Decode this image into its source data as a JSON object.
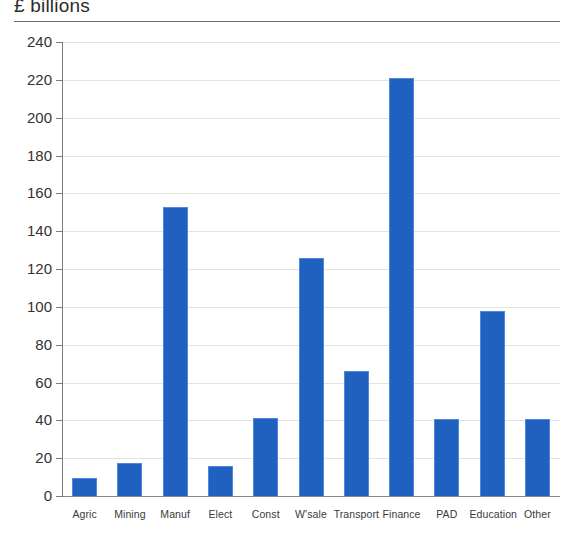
{
  "chart_data": {
    "type": "bar",
    "title": "£ billions",
    "subtitle": "",
    "xlabel": "",
    "ylabel": "",
    "ylim": [
      0,
      240
    ],
    "ytick_step": 20,
    "yticks": [
      0,
      20,
      40,
      60,
      80,
      100,
      120,
      140,
      160,
      180,
      200,
      220,
      240
    ],
    "ytick_labels": [
      "0",
      "20",
      "40",
      "60",
      "80",
      "100",
      "120",
      "140",
      "160",
      "180",
      "200",
      "220",
      "240"
    ],
    "grid": "horizontal",
    "legend": "none",
    "categories": [
      "Agric",
      "Mining",
      "Manuf",
      "Elect",
      "Const",
      "W'sale",
      "Transport",
      "Finance",
      "PAD",
      "Education",
      "Other"
    ],
    "values": [
      9.5,
      17.5,
      153,
      16,
      41.5,
      126,
      66,
      221,
      40.5,
      98,
      40.5
    ],
    "series": [
      {
        "name": "£ billions",
        "color": "#2060be",
        "values": [
          9.5,
          17.5,
          153,
          16,
          41.5,
          126,
          66,
          221,
          40.5,
          98,
          40.5
        ]
      }
    ],
    "bar_color": "#2060be",
    "bar_edge_color": "#4f8ada",
    "gridline_color": "#e3e3e3",
    "axis_color": "#7a7a7a",
    "background": "#ffffff"
  }
}
